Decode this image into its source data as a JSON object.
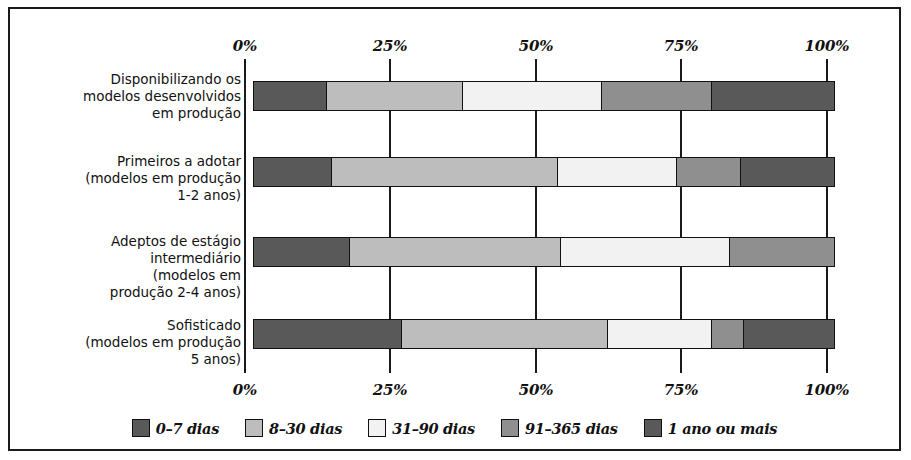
{
  "chart_data": {
    "type": "bar",
    "orientation": "horizontal",
    "stacked": true,
    "normalized_percent": true,
    "title": "",
    "subtitle": "",
    "xlabel": "",
    "ylabel": "",
    "xlim": [
      0,
      100
    ],
    "grid": true,
    "legend_position": "bottom",
    "axis_ticks_top": [
      "0%",
      "25%",
      "50%",
      "75%",
      "100%"
    ],
    "axis_ticks_bottom": [
      "0%",
      "25%",
      "50%",
      "75%",
      "100%"
    ],
    "tick_values": [
      0,
      25,
      50,
      75,
      100
    ],
    "categories": [
      "Disponibilizando os\nmodelos desenvolvidos\nem produção",
      "Primeiros a adotar\n(modelos em produção\n1-2 anos)",
      "Adeptos de estágio\nintermediário\n(modelos em\nprodução 2-4 anos)",
      "Sofisticado\n(modelos em produção\n5 anos)"
    ],
    "series": [
      {
        "name": "0–7 dias",
        "color": "#595959",
        "values": [
          12.5,
          13.5,
          16.5,
          25.5
        ]
      },
      {
        "name": "8–30 dias",
        "color": "#bdbdbd",
        "values": [
          23.5,
          39.0,
          36.5,
          35.5
        ]
      },
      {
        "name": "31–90 dias",
        "color": "#f2f2f2",
        "values": [
          24.0,
          20.5,
          29.0,
          18.0
        ]
      },
      {
        "name": "91–365 dias",
        "color": "#8f8f8f",
        "values": [
          19.0,
          11.0,
          18.0,
          5.5
        ]
      },
      {
        "name": "1 ano ou mais",
        "color": "#595959",
        "values": [
          21.0,
          16.0,
          0.0,
          15.5
        ]
      }
    ]
  },
  "legend": {
    "items": [
      {
        "label": "0–7 dias",
        "color": "#595959"
      },
      {
        "label": "8–30 dias",
        "color": "#bdbdbd"
      },
      {
        "label": "31–90 dias",
        "color": "#f2f2f2"
      },
      {
        "label": "91–365 dias",
        "color": "#8f8f8f"
      },
      {
        "label": "1 ano ou mais",
        "color": "#595959"
      }
    ]
  },
  "colors": {
    "frame": "#1a1a1a",
    "background": "#ffffff",
    "text": "#111111"
  }
}
